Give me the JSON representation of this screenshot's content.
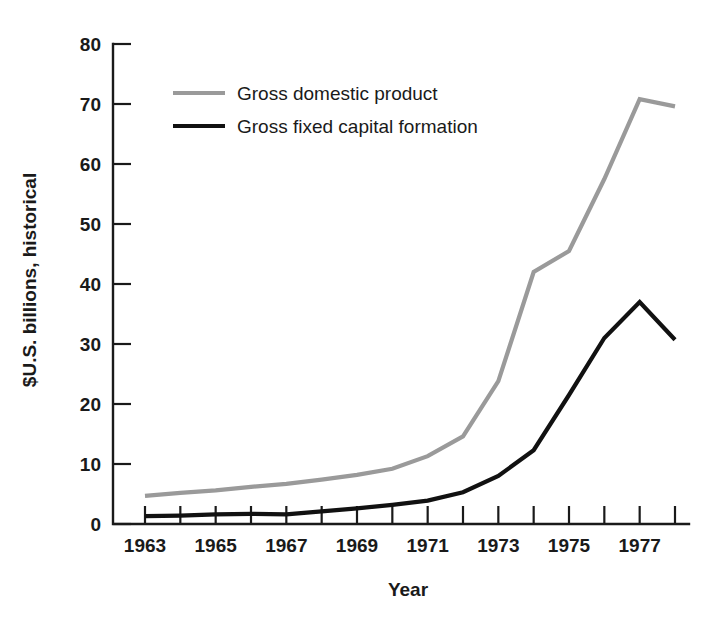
{
  "chart_data": {
    "type": "line",
    "title": "",
    "xlabel": "Year",
    "ylabel": "$U.S. billions, historical",
    "xlim": [
      1963,
      1978
    ],
    "ylim": [
      0,
      80
    ],
    "grid": false,
    "legend_position": "upper-left-inside",
    "x": [
      1963,
      1964,
      1965,
      1966,
      1967,
      1968,
      1969,
      1970,
      1971,
      1972,
      1973,
      1974,
      1975,
      1976,
      1977,
      1978
    ],
    "x_tick_values": [
      1963,
      1964,
      1965,
      1966,
      1967,
      1968,
      1969,
      1970,
      1971,
      1972,
      1973,
      1974,
      1975,
      1976,
      1977,
      1978
    ],
    "x_tick_labels": [
      "1963",
      "",
      "1965",
      "",
      "1967",
      "",
      "1969",
      "",
      "1971",
      "",
      "1973",
      "",
      "1975",
      "",
      "1977",
      ""
    ],
    "y_tick_values": [
      0,
      10,
      20,
      30,
      40,
      50,
      60,
      70,
      80
    ],
    "y_tick_labels": [
      "0",
      "10",
      "20",
      "30",
      "40",
      "50",
      "60",
      "70",
      "80"
    ],
    "series": [
      {
        "name": "Gross domestic product",
        "color": "#9a9a9a",
        "line_width": 4.2,
        "values": [
          4.7,
          5.2,
          5.6,
          6.2,
          6.7,
          7.4,
          8.2,
          9.2,
          11.3,
          14.6,
          23.8,
          42.0,
          45.5,
          57.5,
          70.8,
          69.6
        ]
      },
      {
        "name": "Gross fixed capital formation",
        "color": "#111111",
        "line_width": 4.2,
        "values": [
          1.3,
          1.4,
          1.6,
          1.7,
          1.6,
          2.1,
          2.6,
          3.2,
          3.9,
          5.3,
          8.0,
          12.3,
          21.5,
          31.0,
          37.0,
          30.7
        ]
      }
    ]
  },
  "legend": {
    "items": [
      {
        "label": "Gross domestic product",
        "color": "#9a9a9a"
      },
      {
        "label": "Gross fixed capital formation",
        "color": "#111111"
      }
    ]
  },
  "axes": {
    "x_title": "Year",
    "y_title": "$U.S. billions, historical"
  }
}
